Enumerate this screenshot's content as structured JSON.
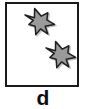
{
  "figure": {
    "label": "d",
    "label_color": "#0d0d0d",
    "panel_width": 86,
    "panel_height": 109,
    "background_color": "#ffffff"
  },
  "box": {
    "border_color": "#1a1a1a",
    "border_width": 2,
    "fill_color": "#ffffff",
    "x": 5,
    "y": 2,
    "width": 74,
    "height": 85
  },
  "shapes": {
    "count": 2,
    "fill_color": "#9a9a9a",
    "outline_color": "#1f1f1f",
    "shadow_color": "#c8c8c8",
    "kind": "irregular-star",
    "items": [
      {
        "name": "star-top-left",
        "cx": 30,
        "cy": 18,
        "size": 30,
        "rotation": -8
      },
      {
        "name": "star-bottom-right",
        "cx": 51,
        "cy": 51,
        "size": 30,
        "rotation": -8
      }
    ]
  }
}
